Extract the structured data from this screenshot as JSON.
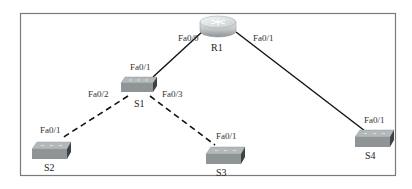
{
  "diagram": {
    "type": "network-topology",
    "devices": [
      {
        "id": "R1",
        "kind": "router",
        "label": "R1"
      },
      {
        "id": "S1",
        "kind": "switch",
        "label": "S1"
      },
      {
        "id": "S2",
        "kind": "switch",
        "label": "S2"
      },
      {
        "id": "S3",
        "kind": "switch",
        "label": "S3"
      },
      {
        "id": "S4",
        "kind": "switch",
        "label": "S4"
      }
    ],
    "links": [
      {
        "from": "R1",
        "from_port": "Fa0/0",
        "to": "S1",
        "to_port": "Fa0/1",
        "style": "solid"
      },
      {
        "from": "R1",
        "from_port": "Fa0/1",
        "to": "S4",
        "to_port": "Fa0/1",
        "style": "solid"
      },
      {
        "from": "S1",
        "from_port": "Fa0/2",
        "to": "S2",
        "to_port": "Fa0/1",
        "style": "dashed"
      },
      {
        "from": "S1",
        "from_port": "Fa0/3",
        "to": "S3",
        "to_port": "Fa0/1",
        "style": "dashed"
      }
    ],
    "colors": {
      "frame": "#777777",
      "link": "#111111",
      "switch_top": "#a9aeb0",
      "switch_front": "#8d9294",
      "switch_side": "#3f4446",
      "router_body": "#c4c8ca"
    }
  },
  "labels": {
    "r1_fa00": "Fa0/0",
    "r1_fa01": "Fa0/1",
    "s1_fa01": "Fa0/1",
    "s1_fa02": "Fa0/2",
    "s1_fa03": "Fa0/3",
    "s2_fa01": "Fa0/1",
    "s3_fa01": "Fa0/1",
    "s4_fa01": "Fa0/1",
    "r1": "R1",
    "s1": "S1",
    "s2": "S2",
    "s3": "S3",
    "s4": "S4"
  }
}
